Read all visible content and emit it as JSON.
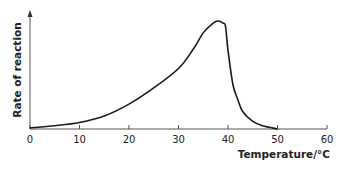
{
  "chart_data": {
    "type": "line",
    "title": "",
    "xlabel": "Temperature/°C",
    "ylabel": "Rate of reaction",
    "xlim": [
      0,
      60
    ],
    "ylim": [
      0,
      110
    ],
    "x_ticks": [
      "0",
      "10",
      "20",
      "30",
      "40",
      "50",
      "60"
    ],
    "y_ticks": [],
    "grid": false,
    "legend": null,
    "series": [
      {
        "name": "Rate of reaction",
        "x": [
          0,
          5,
          10,
          15,
          20,
          25,
          30,
          33,
          35,
          37,
          38,
          39,
          39.5,
          40,
          41,
          42,
          43,
          45,
          47,
          50
        ],
        "y": [
          1,
          3,
          6,
          12,
          23,
          38,
          56,
          74,
          89,
          98,
          100,
          98,
          95,
          73,
          41,
          27,
          16,
          7,
          3,
          0
        ]
      }
    ],
    "annotations": []
  }
}
